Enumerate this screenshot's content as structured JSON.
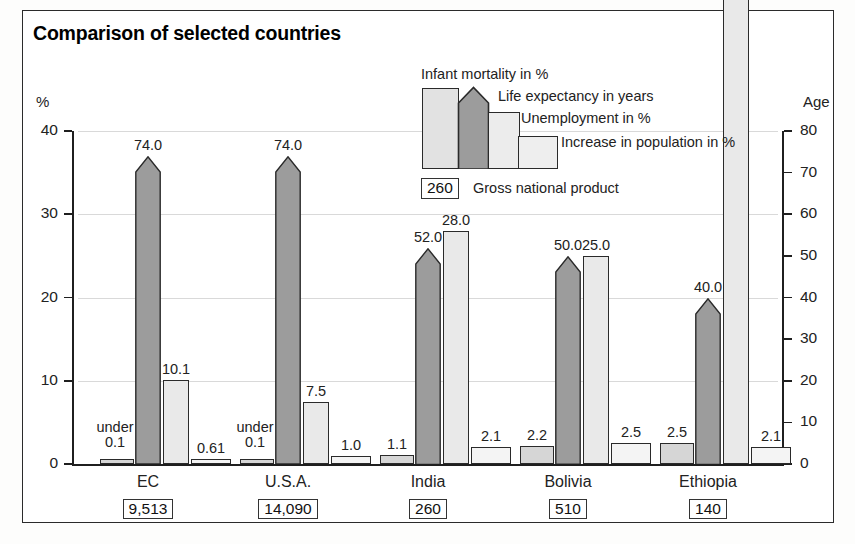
{
  "title": "Comparison of selected countries",
  "axes": {
    "left_label": "%",
    "right_label": "Age",
    "left_ticks": [
      "0",
      "10",
      "20",
      "30",
      "40"
    ],
    "right_ticks": [
      "0",
      "10",
      "20",
      "30",
      "40",
      "50",
      "60",
      "70",
      "80"
    ]
  },
  "legend": {
    "items": [
      {
        "label": "Infant mortality in %",
        "key": "infant"
      },
      {
        "label": "Life expectancy in years",
        "key": "life"
      },
      {
        "label": "Unemployment in %",
        "key": "unemployment"
      },
      {
        "label": "Increase in population in %",
        "key": "population"
      }
    ],
    "gnp_box": "260",
    "gnp_label": "Gross national product"
  },
  "chart_data": {
    "type": "bar",
    "title": "Comparison of selected countries",
    "xlabel": "",
    "ylabel": "%",
    "y2label": "Age",
    "ylim": [
      0,
      40
    ],
    "y2lim": [
      0,
      80
    ],
    "grid": true,
    "legend_position": "top-center",
    "categories": [
      "EC",
      "U.S.A.",
      "India",
      "Bolivia",
      "Ethiopia"
    ],
    "series": [
      {
        "name": "Infant mortality in %",
        "axis": "left",
        "values": [
          0.1,
          0.1,
          1.1,
          2.2,
          2.5
        ],
        "labels": [
          "under\n0.1",
          "under\n0.1",
          "1.1",
          "2.2",
          "2.5"
        ]
      },
      {
        "name": "Life expectancy in years",
        "axis": "right",
        "values": [
          74.0,
          74.0,
          52.0,
          50.0,
          40.0
        ],
        "labels": [
          "74.0",
          "74.0",
          "52.0",
          "50.0",
          "40.0"
        ]
      },
      {
        "name": "Unemployment in %",
        "axis": "left",
        "values": [
          10.1,
          7.5,
          28.0,
          25.0,
          80.0
        ],
        "labels": [
          "10.1",
          "7.5",
          "28.0",
          "25.0",
          "80.0"
        ]
      },
      {
        "name": "Increase in population in %",
        "axis": "left",
        "values": [
          0.61,
          1.0,
          2.1,
          2.5,
          2.1
        ],
        "labels": [
          "0.61",
          "1.0",
          "2.1",
          "2.5",
          "2.1"
        ]
      }
    ],
    "gross_national_product": {
      "label": "Gross national product",
      "values": [
        "9,513",
        "14,090",
        "260",
        "510",
        "140"
      ]
    }
  },
  "colors": {
    "infant": "#d6d6d6",
    "life": "#9c9c9c",
    "unemployment": "#e9e9e9",
    "population": "#f4f4f4",
    "axis": "#1f1f1f",
    "grid": "#d9d9d9",
    "frame": "#2b2b2b"
  }
}
